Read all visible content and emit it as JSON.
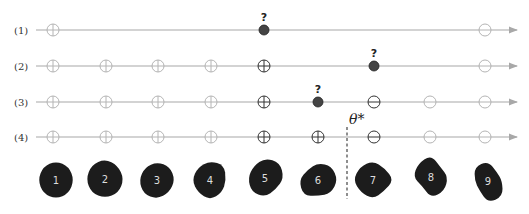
{
  "figure": {
    "rows": [
      {
        "label": "(1)",
        "y": 30,
        "markers": [
          {
            "pos": 1,
            "type": "plus",
            "shade": "light"
          },
          {
            "pos": 5,
            "type": "query",
            "shade": "dark",
            "query_label": "?"
          },
          {
            "pos": 9,
            "type": "minus",
            "shade": "light"
          }
        ]
      },
      {
        "label": "(2)",
        "y": 66,
        "markers": [
          {
            "pos": 1,
            "type": "plus",
            "shade": "light"
          },
          {
            "pos": 2,
            "type": "plus",
            "shade": "light"
          },
          {
            "pos": 3,
            "type": "plus",
            "shade": "light"
          },
          {
            "pos": 4,
            "type": "plus",
            "shade": "light"
          },
          {
            "pos": 5,
            "type": "plus",
            "shade": "dark"
          },
          {
            "pos": 7,
            "type": "query",
            "shade": "dark",
            "query_label": "?"
          },
          {
            "pos": 9,
            "type": "minus",
            "shade": "light"
          }
        ]
      },
      {
        "label": "(3)",
        "y": 102,
        "markers": [
          {
            "pos": 1,
            "type": "plus",
            "shade": "light"
          },
          {
            "pos": 2,
            "type": "plus",
            "shade": "light"
          },
          {
            "pos": 3,
            "type": "plus",
            "shade": "light"
          },
          {
            "pos": 4,
            "type": "plus",
            "shade": "light"
          },
          {
            "pos": 5,
            "type": "plus",
            "shade": "dark"
          },
          {
            "pos": 6,
            "type": "query",
            "shade": "dark",
            "query_label": "?"
          },
          {
            "pos": 7,
            "type": "minus",
            "shade": "dark"
          },
          {
            "pos": 8,
            "type": "minus",
            "shade": "light"
          },
          {
            "pos": 9,
            "type": "minus",
            "shade": "light"
          }
        ]
      },
      {
        "label": "(4)",
        "y": 137,
        "markers": [
          {
            "pos": 1,
            "type": "plus",
            "shade": "light"
          },
          {
            "pos": 2,
            "type": "plus",
            "shade": "light"
          },
          {
            "pos": 3,
            "type": "plus",
            "shade": "light"
          },
          {
            "pos": 4,
            "type": "plus",
            "shade": "light"
          },
          {
            "pos": 5,
            "type": "plus",
            "shade": "dark"
          },
          {
            "pos": 6,
            "type": "plus",
            "shade": "dark"
          },
          {
            "pos": 7,
            "type": "minus",
            "shade": "dark"
          },
          {
            "pos": 8,
            "type": "minus",
            "shade": "light"
          },
          {
            "pos": 9,
            "type": "minus",
            "shade": "light"
          }
        ]
      }
    ],
    "column_x": [
      53,
      106,
      158,
      211,
      264,
      318,
      374,
      430,
      485
    ],
    "threshold": {
      "label": "θ*",
      "x": 347
    },
    "samples": [
      {
        "label": "1",
        "x": 56,
        "y": 180
      },
      {
        "label": "2",
        "x": 105,
        "y": 179
      },
      {
        "label": "3",
        "x": 157,
        "y": 180
      },
      {
        "label": "4",
        "x": 210,
        "y": 180
      },
      {
        "label": "5",
        "x": 265,
        "y": 178
      },
      {
        "label": "6",
        "x": 318,
        "y": 180
      },
      {
        "label": "7",
        "x": 373,
        "y": 180
      },
      {
        "label": "8",
        "x": 431,
        "y": 177
      },
      {
        "label": "9",
        "x": 488,
        "y": 181
      }
    ],
    "colors": {
      "line": "#a8a8a8",
      "light_marker": "#b4b4b4",
      "dark_marker": "#333333",
      "query_dot": "#444444",
      "blob": "#1c1c1c"
    }
  }
}
